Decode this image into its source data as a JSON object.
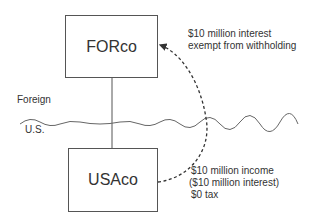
{
  "diagram": {
    "entities": [
      {
        "id": "forco",
        "label": "FORco"
      },
      {
        "id": "usaco",
        "label": "USAco"
      }
    ],
    "jurisdictions": {
      "upper": "Foreign",
      "lower": "U.S."
    },
    "annotations": {
      "payment": [
        "$10 million interest",
        "exempt from withholding"
      ],
      "usaco": [
        "$10 million income",
        "($10 million interest)",
        "$0 tax"
      ]
    },
    "colors": {
      "line": "#555555",
      "text": "#333333",
      "background": "#ffffff"
    }
  }
}
